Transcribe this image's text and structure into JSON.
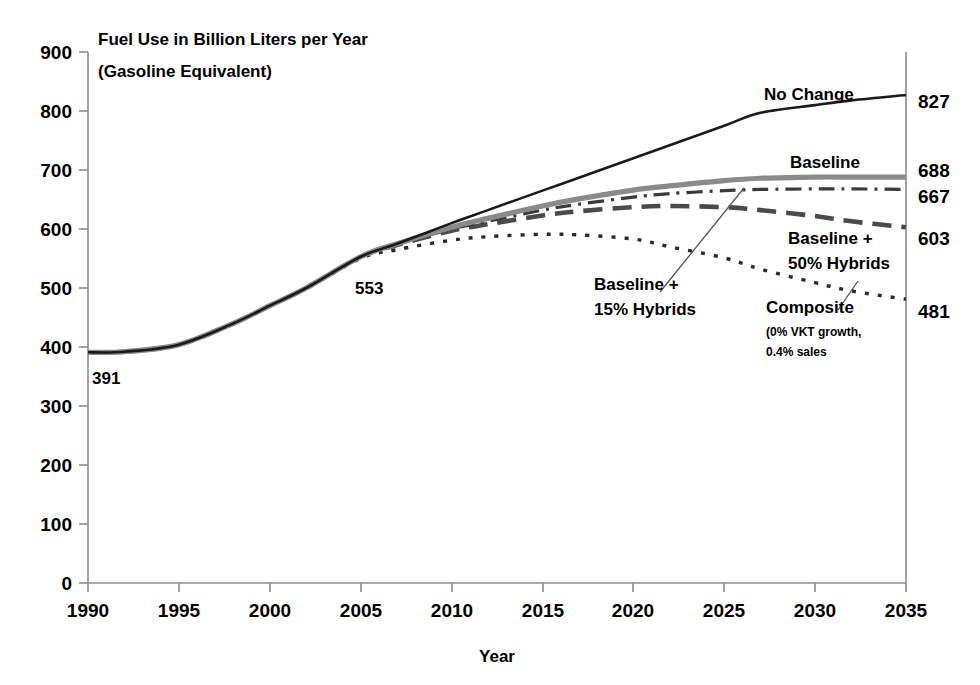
{
  "chart_data": {
    "type": "line",
    "title": "Fuel Use in Billion Liters per Year",
    "subtitle": "(Gasoline Equivalent)",
    "xlabel": "Year",
    "ylabel": "",
    "xlim": [
      1990,
      2035
    ],
    "ylim": [
      0,
      900
    ],
    "grid": false,
    "legend_position": "inline-annotations",
    "xticks": [
      "1990",
      "1995",
      "2000",
      "2005",
      "2010",
      "2015",
      "2020",
      "2025",
      "2030",
      "2035"
    ],
    "yticks": [
      "0",
      "100",
      "200",
      "300",
      "400",
      "500",
      "600",
      "700",
      "800",
      "900"
    ],
    "x": [
      1990,
      1992,
      1995,
      1998,
      2000,
      2002,
      2005,
      2007,
      2010,
      2012,
      2015,
      2017,
      2020,
      2022,
      2025,
      2027,
      2030,
      2032,
      2035
    ],
    "series": [
      {
        "name": "No Change",
        "style": "solid-thin-black",
        "color": "#1a1a1a",
        "end_value": 827,
        "values": [
          391,
          392,
          404,
          440,
          470,
          500,
          553,
          575,
          610,
          632,
          665,
          687,
          720,
          742,
          775,
          797,
          810,
          818,
          827
        ]
      },
      {
        "name": "Baseline",
        "style": "solid-thick-gray",
        "color": "#8a8a8a",
        "end_value": 688,
        "values": [
          391,
          392,
          404,
          440,
          470,
          500,
          553,
          575,
          603,
          618,
          639,
          651,
          666,
          673,
          682,
          686,
          688,
          688,
          688
        ]
      },
      {
        "name": "Baseline + 15% Hybrids",
        "style": "dash-dot",
        "color": "#3a3a3a",
        "end_value": 667,
        "values": [
          391,
          392,
          404,
          440,
          470,
          500,
          553,
          574,
          600,
          613,
          632,
          642,
          654,
          660,
          665,
          667,
          668,
          668,
          667
        ]
      },
      {
        "name": "Baseline + 50% Hybrids",
        "style": "long-dash",
        "color": "#4a4a4a",
        "end_value": 603,
        "values": [
          391,
          392,
          404,
          440,
          470,
          500,
          553,
          573,
          597,
          608,
          623,
          630,
          637,
          639,
          637,
          632,
          622,
          613,
          603
        ]
      },
      {
        "name": "Composite",
        "style": "fine-dot",
        "color": "#2a2a2a",
        "end_value": 481,
        "values": [
          391,
          392,
          404,
          440,
          470,
          499,
          550,
          565,
          581,
          587,
          591,
          590,
          583,
          570,
          551,
          532,
          509,
          495,
          481
        ]
      }
    ],
    "end_labels": [
      {
        "value": "827",
        "series": "No Change"
      },
      {
        "value": "688",
        "series": "Baseline"
      },
      {
        "value": "667",
        "series": "Baseline + 15% Hybrids"
      },
      {
        "value": "603",
        "series": "Baseline + 50% Hybrids"
      },
      {
        "value": "481",
        "series": "Composite"
      }
    ],
    "inline_annotations": [
      {
        "text": "391",
        "at_year": 1990,
        "at_value": 391
      },
      {
        "text": "553",
        "at_year": 2005,
        "at_value": 553
      }
    ],
    "series_labels": [
      {
        "text": "No Change"
      },
      {
        "text": "Baseline"
      },
      {
        "text": "Baseline +",
        "text2": "15% Hybrids"
      },
      {
        "text": "Baseline +",
        "text2": "50% Hybrids"
      },
      {
        "text": "Composite",
        "sub1": "(0% VKT growth,",
        "sub2": "0.4% sales"
      }
    ]
  },
  "labels": {
    "title": "Fuel Use in Billion Liters per Year",
    "subtitle": "(Gasoline Equivalent)",
    "x_axis_title": "Year",
    "no_change": "No Change",
    "baseline": "Baseline",
    "hybrids15_l1": "Baseline +",
    "hybrids15_l2": "15% Hybrids",
    "hybrids50_l1": "Baseline +",
    "hybrids50_l2": "50% Hybrids",
    "composite": "Composite",
    "composite_sub1": "(0% VKT growth,",
    "composite_sub2": "0.4% sales",
    "val_391": "391",
    "val_553": "553",
    "end_827": "827",
    "end_688": "688",
    "end_667": "667",
    "end_603": "603",
    "end_481": "481"
  },
  "yticks": {
    "t0": "0",
    "t1": "100",
    "t2": "200",
    "t3": "300",
    "t4": "400",
    "t5": "500",
    "t6": "600",
    "t7": "700",
    "t8": "800",
    "t9": "900"
  },
  "xticks": {
    "t0": "1990",
    "t1": "1995",
    "t2": "2000",
    "t3": "2005",
    "t4": "2010",
    "t5": "2015",
    "t6": "2020",
    "t7": "2025",
    "t8": "2030",
    "t9": "2035"
  },
  "colors": {
    "axis": "#8c8c8c",
    "no_change": "#1a1a1a",
    "baseline": "#8a8a8a",
    "hybrids15": "#3a3a3a",
    "hybrids50": "#4a4a4a",
    "composite": "#2a2a2a",
    "text": "#000000"
  }
}
